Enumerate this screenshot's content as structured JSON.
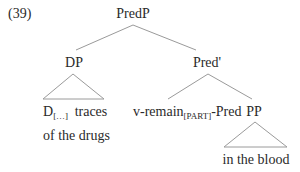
{
  "example_number": "(39)",
  "tree": {
    "root": {
      "label": "PredP"
    },
    "left": {
      "label": "DP",
      "terminal": {
        "head": "D",
        "head_subscript": "[…]",
        "line1_rest": "traces",
        "line2": "of the drugs"
      },
      "triangle": true
    },
    "right": {
      "label": "Pred'",
      "left_child": {
        "prefix": "v-remain",
        "subscript": "[PART]",
        "suffix": "-Pred"
      },
      "right_child": {
        "label": "PP",
        "terminal": "in the blood",
        "triangle": true
      }
    }
  },
  "colors": {
    "text": "#2a2a2a",
    "branch": "#9a9a9a",
    "background": "#ffffff"
  }
}
